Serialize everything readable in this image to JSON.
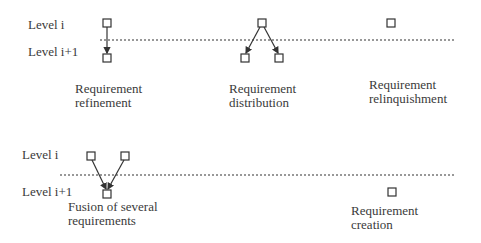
{
  "top_panel": {
    "level_upper": "Level i",
    "level_lower": "Level i+1",
    "cases": [
      {
        "line1": "Requirement",
        "line2": "refinement"
      },
      {
        "line1": "Requirement",
        "line2": "distribution"
      },
      {
        "line1": "Requirement",
        "line2": "relinquishment"
      }
    ]
  },
  "bottom_panel": {
    "level_upper": "Level i",
    "level_lower": "Level i+1",
    "cases": [
      {
        "line1": "Fusion of several",
        "line2": "requirements"
      },
      {
        "line1": "Requirement",
        "line2": "creation"
      }
    ]
  },
  "colors": {
    "stroke": "#333333",
    "background": "#ffffff"
  }
}
